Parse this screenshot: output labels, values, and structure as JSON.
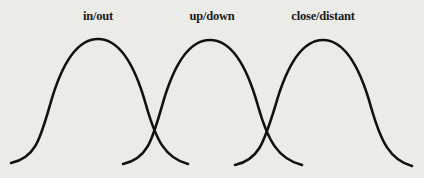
{
  "diagram": {
    "background": "#ebebe8",
    "stroke_color": "#111111",
    "curves": [
      {
        "label": "in/out",
        "label_x": 98,
        "start": [
          11,
          163
        ],
        "peak": [
          98,
          39
        ],
        "end": [
          188,
          164
        ]
      },
      {
        "label": "up/down",
        "label_x": 212,
        "start": [
          123,
          164
        ],
        "peak": [
          210,
          40
        ],
        "end": [
          302,
          165
        ]
      },
      {
        "label": "close/distant",
        "label_x": 323,
        "start": [
          235,
          165
        ],
        "peak": [
          323,
          40
        ],
        "end": [
          412,
          166
        ]
      }
    ]
  }
}
